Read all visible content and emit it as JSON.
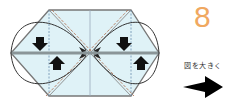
{
  "step": {
    "number": "8",
    "color": "#f0a860"
  },
  "enlarge": {
    "label": "図を大きく",
    "icon": "arrow-right-icon"
  },
  "diagram": {
    "paper_fill": "#dff2f7",
    "edge_color": "#777777",
    "crease_color": "#999999",
    "mountain_fold_color": "#b07050",
    "valley_fold_color": "#6a8fb0",
    "curve_color": "#333333",
    "arrows": [
      "arrow-down",
      "arrow-up",
      "arrow-down",
      "arrow-up"
    ]
  }
}
